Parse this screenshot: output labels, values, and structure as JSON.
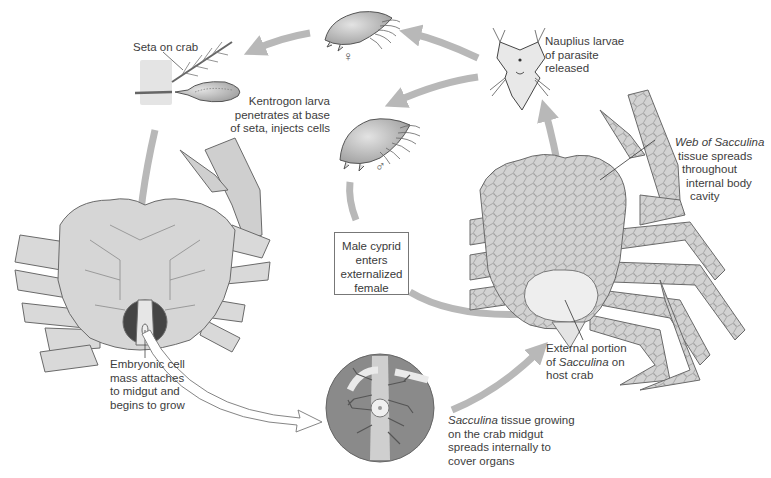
{
  "diagram": {
    "colors": {
      "cycle_arrow": "#b8b8b8",
      "crab_fill": "#d9d9d9",
      "crab_stroke": "#6a6a6a",
      "sacculina_external": "#eeeeee",
      "inset_circle": "#8a8a8a",
      "label_text": "#3d3d3d"
    },
    "labels": {
      "seta": "Seta on crab",
      "kentrogon": [
        "Kentrogon larva",
        "penetrates at base",
        "of seta, injects cells"
      ],
      "nauplius": [
        "Nauplius larvae",
        "of parasite",
        "released"
      ],
      "web_italic": "Web of Sacculina",
      "web_rest": [
        "tissue spreads",
        "throughout",
        "internal body",
        "cavity"
      ],
      "male_cyprid": [
        "Male cyprid",
        "enters",
        "externalized",
        "female"
      ],
      "external_line1": "External portion",
      "external_prefix": "of ",
      "external_italic": "Sacculina",
      "external_suffix": " on",
      "external_line3": "host crab",
      "embryonic": [
        "Embryonic cell",
        "mass attaches",
        "to midgut and",
        "begins to grow"
      ],
      "tissue_italic": "Sacculina",
      "tissue_line1_rest": " tissue growing",
      "tissue_rest": [
        "on the crab midgut",
        "spreads internally to",
        "cover organs"
      ]
    },
    "symbols": {
      "female": "♀",
      "male": "♂"
    },
    "stages": [
      {
        "name": "Nauplius larvae",
        "position": "top-right"
      },
      {
        "name": "Female cyprid",
        "position": "top-center"
      },
      {
        "name": "Kentrogon on seta",
        "position": "top-left"
      },
      {
        "name": "Infected crab (ventral view)",
        "position": "left"
      },
      {
        "name": "Sacculina on midgut (inset)",
        "position": "bottom-center"
      },
      {
        "name": "Crab with external Sacculina",
        "position": "right"
      },
      {
        "name": "Male cyprid",
        "position": "center"
      }
    ]
  }
}
